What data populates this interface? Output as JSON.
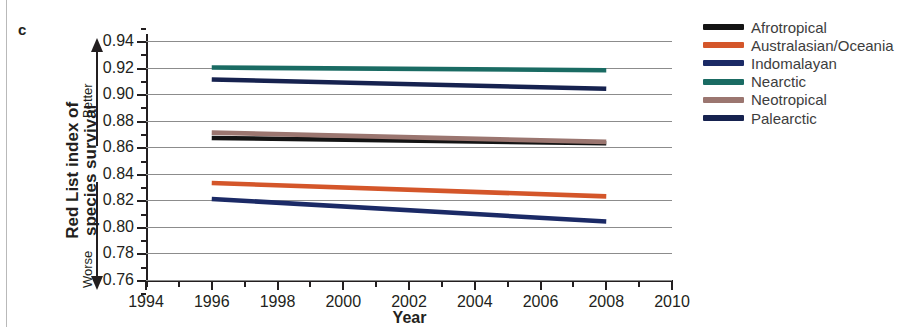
{
  "panel": {
    "letter": "c"
  },
  "axes": {
    "y_title": "Red List index of\nspecies survival",
    "x_title": "Year",
    "better_label": "Better",
    "worse_label": "Worse",
    "y_ticks": [
      "0.94",
      "0.92",
      "0.90",
      "0.88",
      "0.86",
      "0.84",
      "0.82",
      "0.80",
      "0.78",
      "0.76"
    ],
    "x_ticks": [
      "1994",
      "1996",
      "1998",
      "2000",
      "2002",
      "2004",
      "2006",
      "2008",
      "2010"
    ]
  },
  "legend": {
    "items": [
      {
        "label": "Afrotropical",
        "color": "#141414"
      },
      {
        "label": "Australasian/Oceania",
        "color": "#d4562a"
      },
      {
        "label": "Indomalayan",
        "color": "#1b2a66"
      },
      {
        "label": "Nearctic",
        "color": "#1a6b63"
      },
      {
        "label": "Neotropical",
        "color": "#9b7670"
      },
      {
        "label": "Palearctic",
        "color": "#16224f"
      }
    ]
  },
  "chart_data": {
    "type": "line",
    "title": "Red List index of species survival",
    "xlabel": "Year",
    "ylabel": "Red List index of species survival",
    "xlim": [
      1994,
      2010
    ],
    "ylim": [
      0.75,
      0.95
    ],
    "grid": true,
    "legend_position": "right",
    "x": [
      1996,
      2008
    ],
    "annotations": [
      "Better",
      "Worse",
      "c"
    ],
    "series": [
      {
        "name": "Afrotropical",
        "color": "#141414",
        "values": [
          0.867,
          0.863
        ]
      },
      {
        "name": "Australasian/Oceania",
        "color": "#d4562a",
        "values": [
          0.833,
          0.823
        ]
      },
      {
        "name": "Indomalayan",
        "color": "#1b2a66",
        "values": [
          0.821,
          0.804
        ]
      },
      {
        "name": "Nearctic",
        "color": "#1a6b63",
        "values": [
          0.92,
          0.918
        ]
      },
      {
        "name": "Neotropical",
        "color": "#9b7670",
        "values": [
          0.871,
          0.864
        ]
      },
      {
        "name": "Palearctic",
        "color": "#16224f",
        "values": [
          0.911,
          0.904
        ]
      }
    ]
  }
}
